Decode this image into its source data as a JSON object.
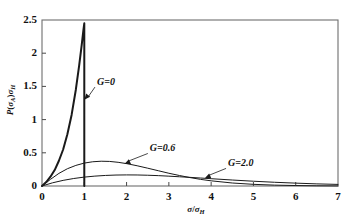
{
  "chart_data": {
    "type": "line",
    "title": "",
    "xlabel": "σ/σH",
    "ylabel": "P(σA)σH",
    "xlim": [
      0,
      7
    ],
    "ylim": [
      0,
      2.5
    ],
    "xticks": [
      "0",
      "1",
      "2",
      "3",
      "4",
      "5",
      "6",
      "7"
    ],
    "yticks": [
      "0",
      "0.5",
      "1",
      "1.5",
      "2",
      "2.5"
    ],
    "grid": false,
    "legend": "inline-annotations",
    "series": [
      {
        "name": "G=0",
        "label": "G=0",
        "points": [
          [
            0.0,
            0.0
          ],
          [
            0.1,
            0.06
          ],
          [
            0.2,
            0.14
          ],
          [
            0.3,
            0.24
          ],
          [
            0.4,
            0.38
          ],
          [
            0.5,
            0.55
          ],
          [
            0.6,
            0.78
          ],
          [
            0.7,
            1.07
          ],
          [
            0.8,
            1.45
          ],
          [
            0.88,
            1.82
          ],
          [
            0.94,
            2.13
          ],
          [
            0.98,
            2.35
          ],
          [
            1.0,
            2.45
          ],
          [
            1.0,
            0.0
          ]
        ]
      },
      {
        "name": "G=0.6",
        "label": "G=0.6",
        "points": [
          [
            0.0,
            0.0
          ],
          [
            0.2,
            0.1
          ],
          [
            0.4,
            0.19
          ],
          [
            0.6,
            0.26
          ],
          [
            0.8,
            0.31
          ],
          [
            1.0,
            0.345
          ],
          [
            1.2,
            0.365
          ],
          [
            1.4,
            0.373
          ],
          [
            1.6,
            0.37
          ],
          [
            1.8,
            0.357
          ],
          [
            2.0,
            0.337
          ],
          [
            2.25,
            0.305
          ],
          [
            2.5,
            0.268
          ],
          [
            2.75,
            0.23
          ],
          [
            3.0,
            0.192
          ],
          [
            3.25,
            0.158
          ],
          [
            3.5,
            0.127
          ],
          [
            3.75,
            0.1
          ],
          [
            4.0,
            0.078
          ],
          [
            4.5,
            0.045
          ],
          [
            5.0,
            0.025
          ],
          [
            5.5,
            0.013
          ],
          [
            6.0,
            0.007
          ],
          [
            6.5,
            0.003
          ],
          [
            7.0,
            0.001
          ]
        ]
      },
      {
        "name": "G=2.0",
        "label": "G=2.0",
        "points": [
          [
            0.0,
            0.0
          ],
          [
            0.25,
            0.048
          ],
          [
            0.5,
            0.085
          ],
          [
            0.75,
            0.113
          ],
          [
            1.0,
            0.134
          ],
          [
            1.25,
            0.149
          ],
          [
            1.5,
            0.159
          ],
          [
            1.75,
            0.165
          ],
          [
            2.0,
            0.167
          ],
          [
            2.25,
            0.166
          ],
          [
            2.5,
            0.162
          ],
          [
            2.75,
            0.156
          ],
          [
            3.0,
            0.148
          ],
          [
            3.25,
            0.139
          ],
          [
            3.5,
            0.13
          ],
          [
            3.75,
            0.12
          ],
          [
            4.0,
            0.11
          ],
          [
            4.5,
            0.09
          ],
          [
            5.0,
            0.072
          ],
          [
            5.5,
            0.056
          ],
          [
            6.0,
            0.043
          ],
          [
            6.5,
            0.032
          ],
          [
            7.0,
            0.024
          ]
        ]
      }
    ],
    "annotations": [
      {
        "text": "G=0",
        "x_data": 1.0,
        "y_data": 1.3,
        "label_x": 1.3,
        "label_y": 1.52
      },
      {
        "text": "G=0.6",
        "x_data": 1.95,
        "y_data": 0.33,
        "label_x": 2.55,
        "label_y": 0.52
      },
      {
        "text": "G=2.0",
        "x_data": 3.85,
        "y_data": 0.115,
        "label_x": 4.4,
        "label_y": 0.295
      }
    ]
  }
}
